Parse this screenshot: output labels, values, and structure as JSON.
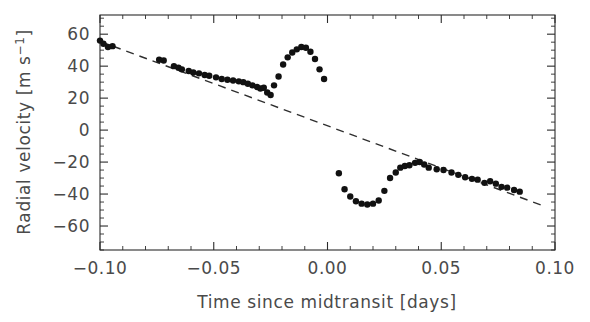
{
  "figure": {
    "background": "#ffffff",
    "ink_color": "#111111",
    "axis_color": "#2b2b2b",
    "label_color": "#4a4a4a"
  },
  "axes": {
    "x_title": "Time since midtransit [days]",
    "y_title_main": "Radial velocity [m s",
    "y_title_exp": "−1",
    "y_title_close": "]",
    "y_title_full": "Radial velocity [m s⁻¹]",
    "x_ticklabels": [
      "−0.10",
      "−0.05",
      "0.00",
      "0.05",
      "0.10"
    ],
    "y_ticklabels": [
      "60",
      "40",
      "20",
      "0",
      "−20",
      "−40",
      "−60"
    ]
  },
  "chart_data": {
    "type": "scatter",
    "title": "",
    "xlabel": "Time since midtransit [days]",
    "ylabel": "Radial velocity [m s^-1]",
    "xlim": [
      -0.1,
      0.1
    ],
    "ylim": [
      -75,
      72
    ],
    "xticks": [
      -0.1,
      -0.05,
      0.0,
      0.05,
      0.1
    ],
    "yticks": [
      60,
      40,
      20,
      0,
      -20,
      -40,
      -60
    ],
    "minor_ticks_per_interval": 5,
    "grid": false,
    "legend": null,
    "series": [
      {
        "name": "Radial velocity measurements",
        "type": "scatter",
        "marker": "filled-circle",
        "marker_size_px": 5.2,
        "color": "#111111",
        "x": [
          -0.1,
          -0.0985,
          -0.0965,
          -0.0945,
          -0.074,
          -0.072,
          -0.0675,
          -0.0655,
          -0.064,
          -0.061,
          -0.059,
          -0.0565,
          -0.054,
          -0.052,
          -0.049,
          -0.0465,
          -0.044,
          -0.0415,
          -0.039,
          -0.037,
          -0.035,
          -0.033,
          -0.031,
          -0.0295,
          -0.028,
          -0.0265,
          -0.025,
          -0.0235,
          -0.0215,
          -0.0195,
          -0.0175,
          -0.0155,
          -0.0135,
          -0.0115,
          -0.0095,
          -0.0075,
          -0.0055,
          -0.0035,
          -0.0015,
          0.005,
          0.0075,
          0.01,
          0.0125,
          0.015,
          0.0175,
          0.02,
          0.0225,
          0.025,
          0.0275,
          0.03,
          0.032,
          0.034,
          0.036,
          0.0385,
          0.0405,
          0.0425,
          0.0445,
          0.048,
          0.051,
          0.0545,
          0.0575,
          0.0605,
          0.0635,
          0.066,
          0.069,
          0.0715,
          0.074,
          0.0765,
          0.079,
          0.082,
          0.0845
        ],
        "y": [
          56.0,
          54.0,
          52.0,
          52.5,
          44.0,
          43.5,
          40.0,
          39.0,
          38.0,
          37.0,
          36.0,
          35.5,
          34.5,
          34.0,
          33.0,
          32.0,
          31.5,
          31.0,
          30.5,
          30.0,
          29.0,
          28.0,
          27.0,
          26.0,
          26.5,
          23.5,
          22.0,
          28.0,
          33.5,
          41.0,
          45.5,
          48.5,
          50.5,
          52.0,
          51.5,
          49.0,
          44.5,
          38.0,
          32.0,
          -27.0,
          -37.0,
          -41.5,
          -44.5,
          -46.0,
          -46.5,
          -46.0,
          -44.0,
          -38.0,
          -30.0,
          -26.5,
          -23.5,
          -22.5,
          -22.0,
          -20.5,
          -20.0,
          -21.5,
          -23.5,
          -24.5,
          -25.0,
          -26.5,
          -28.0,
          -29.5,
          -30.5,
          -31.0,
          -33.0,
          -32.0,
          -33.5,
          -35.5,
          -36.0,
          -37.5,
          -38.5
        ]
      },
      {
        "name": "Keplerian orbit model (no RM effect)",
        "type": "line",
        "style": "dashed",
        "color": "#2f2f2f",
        "x": [
          -0.1,
          0.096
        ],
        "y": [
          55.5,
          -48.0
        ]
      }
    ]
  }
}
